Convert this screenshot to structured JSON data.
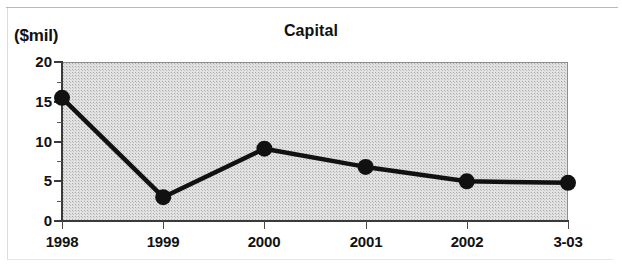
{
  "chart_data": {
    "type": "line",
    "title": "Capital",
    "xlabel": "",
    "ylabel": "($mil)",
    "unit_label": "($mil)",
    "categories": [
      "1998",
      "1999",
      "2000",
      "2001",
      "2002",
      "3-03"
    ],
    "values": [
      15.5,
      3.0,
      9.1,
      6.8,
      5.0,
      4.8
    ],
    "series": [
      {
        "name": "Capital",
        "values": [
          15.5,
          3.0,
          9.1,
          6.8,
          5.0,
          4.8
        ]
      }
    ],
    "ylim": [
      0,
      20
    ],
    "ytick_labels": [
      "0",
      "5",
      "10",
      "15",
      "20"
    ],
    "ytick_values": [
      0,
      5,
      10,
      15,
      20
    ],
    "yminor_values": [
      2.5,
      7.5,
      12.5,
      17.5
    ],
    "xtick_labels": [
      "1998",
      "1999",
      "2000",
      "2001",
      "2002",
      "3-03"
    ],
    "grid": false,
    "legend": "none",
    "marker": "filled-circle",
    "line_color": "#111111",
    "marker_color": "#111111",
    "plot_background": "#e2e2e2"
  }
}
